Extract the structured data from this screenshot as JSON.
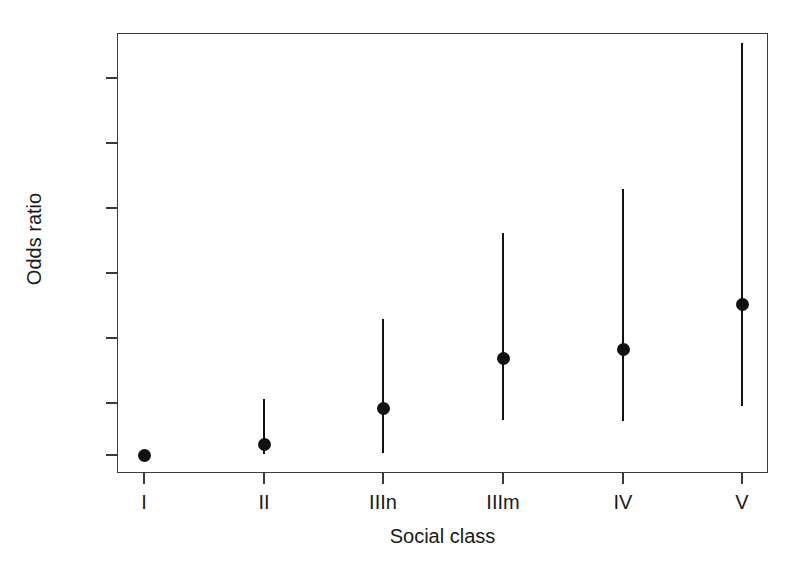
{
  "figure": {
    "background_color": "#ffffff",
    "ink_color": "#111111",
    "axis_color": "#3a3a3a"
  },
  "axes": {
    "y_title": "Odds ratio",
    "x_title": "Social class",
    "y_ticks": [
      1,
      5,
      10,
      15,
      20,
      25,
      30
    ],
    "y_tick_labels": [
      "1",
      "5",
      "10",
      "15",
      "20",
      "25",
      "30"
    ],
    "x_tick_labels": [
      "I",
      "II",
      "IIIn",
      "IIIm",
      "IV",
      "V"
    ]
  },
  "chart_data": {
    "type": "scatter",
    "title": "",
    "subtitle": "",
    "xlabel": "Social class",
    "ylabel": "Odds ratio",
    "categories": [
      "I",
      "II",
      "IIIn",
      "IIIm",
      "IV",
      "V"
    ],
    "values": [
      1.0,
      1.8,
      4.6,
      8.4,
      9.1,
      12.6
    ],
    "error_low": [
      1.0,
      1.05,
      1.15,
      3.7,
      3.6,
      4.8
    ],
    "error_high": [
      1.0,
      5.3,
      11.5,
      18.1,
      21.5,
      32.7
    ],
    "point_labels": [
      "1.0",
      "1.8",
      "4.6",
      "8.4",
      "9.1",
      "12.6"
    ],
    "series": [
      {
        "name": "Odds ratio (95% CI)",
        "values": [
          1.0,
          1.8,
          4.6,
          8.4,
          9.1,
          12.6
        ]
      }
    ],
    "ylim": [
      0.2,
      34
    ],
    "xlim": [
      0,
      7
    ],
    "grid": false,
    "legend": false,
    "legend_position": "none",
    "marker": "filled-circle",
    "errorbar_style": "vertical-line-no-caps",
    "reference_category": "I",
    "annotations": []
  }
}
